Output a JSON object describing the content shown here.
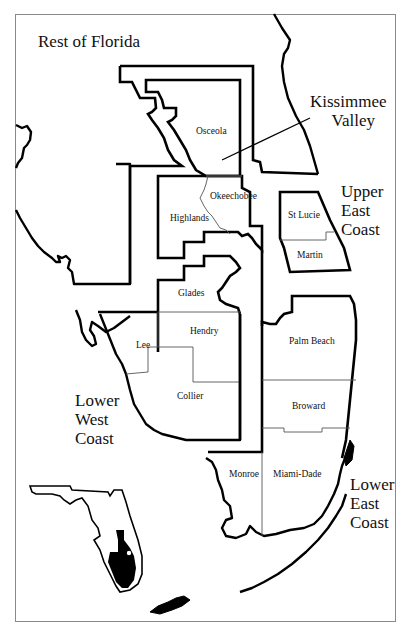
{
  "map": {
    "title_region": "Rest of Florida",
    "regions": [
      {
        "id": "kissimmee-valley",
        "label_line1": "Kissimmee",
        "label_line2": "Valley",
        "counties": [
          "Osceola",
          "Okeechobee",
          "Highlands"
        ]
      },
      {
        "id": "upper-east-coast",
        "label_line1": "Upper",
        "label_line2": "East",
        "label_line3": "Coast",
        "counties": [
          "St Lucie",
          "Martin"
        ]
      },
      {
        "id": "lower-west-coast",
        "label_line1": "Lower",
        "label_line2": "West",
        "label_line3": "Coast",
        "counties": [
          "Glades",
          "Lee",
          "Hendry",
          "Collier"
        ]
      },
      {
        "id": "lower-east-coast",
        "label_line1": "Lower",
        "label_line2": "East",
        "label_line3": "Coast",
        "counties": [
          "Palm Beach",
          "Broward",
          "Miami-Dade",
          "Monroe"
        ]
      }
    ],
    "counties": {
      "osceola": "Osceola",
      "okeechobee": "Okeechobee",
      "highlands": "Highlands",
      "st_lucie": "St Lucie",
      "martin": "Martin",
      "glades": "Glades",
      "lee": "Lee",
      "hendry": "Hendry",
      "collier": "Collier",
      "palm_beach": "Palm Beach",
      "broward": "Broward",
      "monroe": "Monroe",
      "miami_dade": "Miami-Dade"
    },
    "inset": {
      "description": "Florida locator map with study area highlighted",
      "highlight_color": "#000000"
    }
  }
}
